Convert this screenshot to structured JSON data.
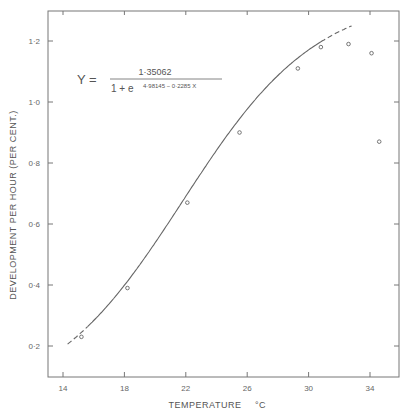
{
  "chart_data": {
    "type": "scatter",
    "title": "",
    "xlabel": "TEMPERATURE °C",
    "ylabel": "DEVELOPMENT PER HOUR (PER CENT.)",
    "xlim": [
      13,
      36
    ],
    "ylim": [
      0.1,
      1.3
    ],
    "grid": false,
    "x_ticks": [
      14,
      18,
      22,
      26,
      30,
      34
    ],
    "x_tick_labels": [
      "14",
      "18",
      "22",
      "26",
      "30",
      "34"
    ],
    "y_ticks": [
      0.2,
      0.4,
      0.6,
      0.8,
      1.0,
      1.2
    ],
    "y_tick_labels": [
      "0·2",
      "0·4",
      "0·6",
      "0·8",
      "1·0",
      "1·2"
    ],
    "series": [
      {
        "name": "observed",
        "marker": "open-circle",
        "x": [
          15.2,
          18.2,
          22.1,
          25.5,
          29.3,
          30.8,
          32.6,
          34.1,
          34.6
        ],
        "y": [
          0.23,
          0.39,
          0.67,
          0.9,
          1.11,
          1.18,
          1.19,
          1.16,
          0.87
        ]
      },
      {
        "name": "logistic fit",
        "type": "line",
        "equation": "Y = 1.35062 / (1 + e^(4.98145 - 0.2285 X))",
        "K": 1.35062,
        "a": 4.98145,
        "b": 0.2285,
        "solid_range": [
          15.6,
          30.8
        ],
        "dashed_ranges": [
          [
            14.3,
            15.6
          ],
          [
            30.8,
            32.8
          ]
        ]
      }
    ],
    "annotations": [
      {
        "text": "Y = 1·35062 / (1 + e^(4·98145 − 0·2285 X))",
        "position": "upper-left"
      }
    ]
  },
  "equation": {
    "lhs": "Y =",
    "numerator": "1·35062",
    "denominator_base": "1 + e",
    "exponent": "4·98145 − 0·2285 X"
  },
  "axes": {
    "x_title": "TEMPERATURE",
    "x_unit": "°C",
    "y_title": "DEVELOPMENT  PER  HOUR  (PER CENT.)"
  }
}
